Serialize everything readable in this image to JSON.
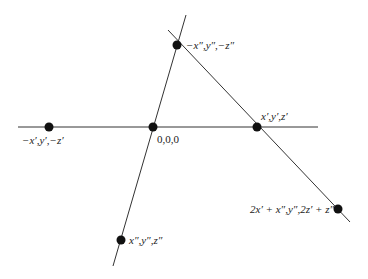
{
  "diagram": {
    "points": [
      {
        "id": "top",
        "label": "−x″,y″,−z″"
      },
      {
        "id": "left",
        "label": "−x′,y′,−z′"
      },
      {
        "id": "origin",
        "label": "0,0,0"
      },
      {
        "id": "right",
        "label": "x′,y′,z′"
      },
      {
        "id": "lower-right",
        "label": "2x′ + x″,y″,2z′ + z″"
      },
      {
        "id": "bottom",
        "label": "x″,y″,z″"
      }
    ],
    "colors": {
      "line": "#333333",
      "point": "#111111",
      "text": "#222222"
    }
  }
}
